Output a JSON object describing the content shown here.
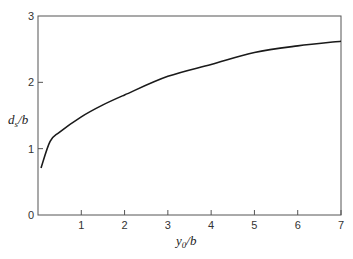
{
  "chart_data": {
    "type": "line",
    "title": "",
    "xlabel": "y0/b",
    "ylabel": "ds/b",
    "xlim": [
      0,
      7
    ],
    "ylim": [
      0,
      3
    ],
    "grid": false,
    "legend": null,
    "x_ticks": [
      "1",
      "2",
      "3",
      "4",
      "5",
      "6",
      "7"
    ],
    "y_ticks": [
      "0",
      "1",
      "2",
      "3"
    ],
    "series": [
      {
        "name": "ds/b vs y0/b",
        "x": [
          0.07,
          0.28,
          0.5,
          1.0,
          1.5,
          2.0,
          3.0,
          4.0,
          5.0,
          6.0,
          7.0
        ],
        "y": [
          0.71,
          1.11,
          1.25,
          1.48,
          1.66,
          1.81,
          2.09,
          2.27,
          2.45,
          2.55,
          2.62
        ]
      }
    ]
  },
  "axes": {
    "x_label_main": "y",
    "x_label_sub": "0",
    "x_label_rest": "/b",
    "y_label_main": "d",
    "y_label_sub": "s",
    "y_label_rest": "/b"
  }
}
